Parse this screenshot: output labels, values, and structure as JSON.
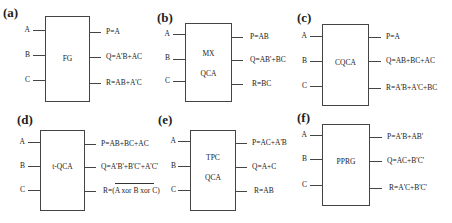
{
  "panels": [
    {
      "id": "a",
      "label": "(a)",
      "title_lines": [
        "FG"
      ],
      "inputs": [
        "A",
        "B",
        "C"
      ],
      "outputs": [
        "P=A",
        "Q=A'B+AC",
        "R=AB+A'C"
      ]
    },
    {
      "id": "b",
      "label": "(b)",
      "title_lines": [
        "MX",
        "QCA"
      ],
      "inputs": [
        "A",
        "B",
        "C"
      ],
      "outputs": [
        "P=AB",
        "Q=AB'+BC",
        "R=BC"
      ]
    },
    {
      "id": "c",
      "label": "(c)",
      "title_lines": [
        "CQCA"
      ],
      "inputs": [
        "A",
        "B",
        "C"
      ],
      "outputs": [
        "P=A",
        "Q=AB+BC+AC",
        "R=A'B+A'C+BC"
      ]
    },
    {
      "id": "d",
      "label": "(d)",
      "title_lines": [
        "t-QCA"
      ],
      "inputs": [
        "A",
        "B",
        "C"
      ],
      "outputs": [
        "P=AB+BC+AC",
        "Q=A'B'+B'C'+A'C'",
        "R=(A xor B xor C)"
      ],
      "overbar_on": "R"
    },
    {
      "id": "e",
      "label": "(e)",
      "title_lines": [
        "TPC",
        "QCA"
      ],
      "inputs": [
        "A",
        "B",
        "C"
      ],
      "outputs": [
        "P=AC+A'B",
        "Q=A+C",
        "R=AB"
      ]
    },
    {
      "id": "f",
      "label": "(f)",
      "title_lines": [
        "PPRG"
      ],
      "inputs": [
        "A",
        "B",
        "C"
      ],
      "outputs": [
        "P=A'B+AB'",
        "Q=AC+B'C'",
        "R=A'C+B'C'"
      ]
    }
  ]
}
